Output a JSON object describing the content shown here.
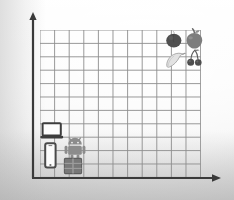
{
  "scene": {
    "title": "Coordinate grid sorting activity",
    "background_color": "#f0f0f0"
  },
  "axes": {
    "color": "#3a3a3a",
    "x_axis_name": "horizontal-axis",
    "y_axis_name": "vertical-axis",
    "x_arrow": "arrow-right",
    "y_arrow": "arrow-up"
  },
  "grid": {
    "columns": 11,
    "rows": 11,
    "cell_width": 14.6,
    "cell_height": 13.4,
    "line_color": "#8d8d8d",
    "line_width": 0.9
  },
  "chart_data": {
    "type": "scatter",
    "xlabel": "",
    "ylabel": "",
    "xlim": [
      0,
      11
    ],
    "ylim": [
      0,
      11
    ],
    "grid": true,
    "legend": "none",
    "categories": [
      "fruit",
      "technology"
    ],
    "points": [
      {
        "label": "plum",
        "group": "fruit",
        "x": 8.5,
        "y": 10.3,
        "color": "#4a4a4a"
      },
      {
        "label": "apple",
        "group": "fruit",
        "x": 9.9,
        "y": 10.4,
        "color": "#7a7a7a"
      },
      {
        "label": "banana",
        "group": "fruit",
        "x": 8.6,
        "y": 8.8,
        "color": "#d8d8d8"
      },
      {
        "label": "cherries",
        "group": "fruit",
        "x": 10.1,
        "y": 9.0,
        "color": "#555555"
      },
      {
        "label": "laptop",
        "group": "technology",
        "x": 0.5,
        "y": 4.1,
        "color": "#3f3f3f"
      },
      {
        "label": "phone",
        "group": "technology",
        "x": 0.7,
        "y": 2.6,
        "color": "#4b4b4b"
      },
      {
        "label": "robot",
        "group": "technology",
        "x": 2.0,
        "y": 3.0,
        "color": "#8a8a8a"
      },
      {
        "label": "chip",
        "group": "technology",
        "x": 1.9,
        "y": 1.5,
        "color": "#7b7b7b"
      }
    ]
  },
  "stickers": {
    "fruit": [
      {
        "name": "plum-sticker",
        "label": "plum",
        "icon": "plum-icon",
        "fill": "#4f4f4f"
      },
      {
        "name": "apple-sticker",
        "label": "apple",
        "icon": "apple-icon",
        "fill": "#7d7d7d"
      },
      {
        "name": "banana-sticker",
        "label": "banana",
        "icon": "banana-icon",
        "fill": "#dedede"
      },
      {
        "name": "cherry-sticker",
        "label": "cherries",
        "icon": "cherries-icon",
        "fill": "#4d4d4d"
      }
    ],
    "technology": [
      {
        "name": "laptop-sticker",
        "label": "laptop",
        "icon": "laptop-icon",
        "fill": "#3d3d3d"
      },
      {
        "name": "phone-sticker",
        "label": "mobile phone",
        "icon": "phone-icon",
        "fill": "#4a4a4a"
      },
      {
        "name": "robot-sticker",
        "label": "android robot",
        "icon": "robot-icon",
        "fill": "#8c8c8c"
      },
      {
        "name": "chip-sticker",
        "label": "chip",
        "icon": "chip-icon",
        "fill": "#787878"
      }
    ]
  }
}
